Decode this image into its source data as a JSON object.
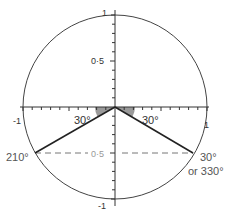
{
  "diagram": {
    "axis_labels": {
      "y_top": "1",
      "y_half": "0·5",
      "x_left": "-1",
      "x_right": "1",
      "y_neg_half": "0·5",
      "y_bottom": "-1"
    },
    "angle_labels": {
      "left_angle": "30°",
      "right_angle": "30°"
    },
    "point_labels": {
      "left_point": "210°",
      "right_point_line1": "30°",
      "right_point_line2": "or 330°"
    },
    "colors": {
      "line": "#222222",
      "circle": "#444444",
      "shade": "#9a9a9a",
      "dashed": "#777777"
    }
  }
}
